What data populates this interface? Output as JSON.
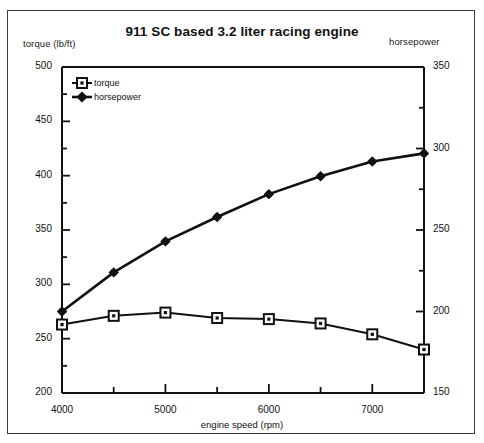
{
  "chart_data": {
    "type": "line",
    "title": "911 SC based 3.2 liter racing engine",
    "xlabel": "engine speed (rpm)",
    "ylabel_left": "torque (lb/ft)",
    "ylabel_right": "horsepower",
    "x": [
      4000,
      4500,
      5000,
      5500,
      6000,
      6500,
      7000,
      7500
    ],
    "xlim": [
      4000,
      7500
    ],
    "xticks_major": [
      4000,
      5000,
      6000,
      7000
    ],
    "xticks_minor": [
      4500,
      5500,
      6500,
      7500
    ],
    "xtick_labels": [
      "4000",
      "5000",
      "6000",
      "7000"
    ],
    "ylim_left": [
      200,
      500
    ],
    "yticks_left": [
      200,
      250,
      300,
      350,
      400,
      450,
      500
    ],
    "ytick_labels_left": [
      "200",
      "250",
      "300",
      "350",
      "400",
      "450",
      "500"
    ],
    "yticks_minor_left": [
      225,
      275,
      325,
      375,
      425,
      475
    ],
    "ylim_right": [
      150,
      350
    ],
    "yticks_right": [
      150,
      200,
      250,
      300,
      350
    ],
    "ytick_labels_right": [
      "150",
      "200",
      "250",
      "300",
      "350"
    ],
    "yticks_minor_right": [
      175,
      225,
      275,
      325
    ],
    "grid": false,
    "legend_position": "top-left",
    "series": [
      {
        "name": "torque",
        "axis": "left",
        "marker": "open-square",
        "color": "#111111",
        "values": [
          263,
          271,
          274,
          269,
          268,
          264,
          254,
          240
        ]
      },
      {
        "name": "horsepower",
        "axis": "right",
        "marker": "filled-diamond",
        "color": "#111111",
        "values": [
          200,
          224,
          243,
          258,
          272,
          283,
          292,
          297
        ]
      }
    ]
  },
  "legend": {
    "items": [
      {
        "label": "torque"
      },
      {
        "label": "horsepower"
      }
    ]
  },
  "colors": {
    "ink": "#111111",
    "frame": "#3a3a3a",
    "background": "#ffffff"
  }
}
